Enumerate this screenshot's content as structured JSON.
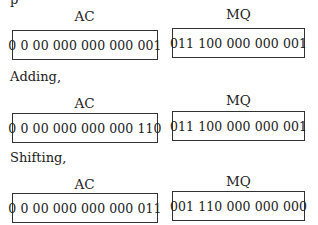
{
  "top_fragment": "p",
  "sections": [
    {
      "label": "",
      "ac_title": "AC",
      "mq_title": "MQ",
      "ac": "0 0 00 000 000 000 001",
      "mq": "011 100 000 000 001"
    },
    {
      "label": "Adding,",
      "ac_title": "AC",
      "mq_title": "MQ",
      "ac": "0 0 00 000 000 000 110",
      "mq": "011 100 000 000 001"
    },
    {
      "label": "Shifting,",
      "ac_title": "AC",
      "mq_title": "MQ",
      "ac": "0 0 00 000 000 000 011",
      "mq": "001 110 000 000 000"
    }
  ]
}
